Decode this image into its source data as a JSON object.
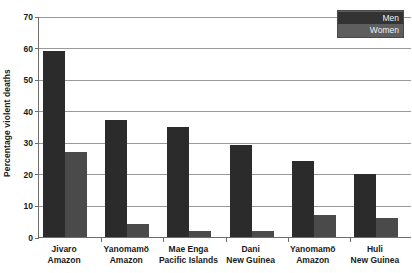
{
  "chart_data": {
    "type": "bar",
    "title": "",
    "subtitle": "",
    "xlabel": "",
    "ylabel": "Percentage violent deaths",
    "ylim": [
      0,
      70
    ],
    "ytick_step": 10,
    "yticks": [
      0,
      10,
      20,
      30,
      40,
      50,
      60,
      70
    ],
    "ytick_labels": [
      "0",
      "10",
      "20",
      "30",
      "40",
      "50",
      "60",
      "70"
    ],
    "grid": true,
    "legend_position": "top-right",
    "categories": [
      "Jivaro\nAmazon",
      "Yanomamö\nAmazon",
      "Mae Enga\nPacific Islands",
      "Dani\nNew Guinea",
      "Yanomamö\nAmazon",
      "Huli\nNew Guinea"
    ],
    "category_lines": [
      {
        "line1": "Jivaro",
        "line2": "Amazon"
      },
      {
        "line1": "Yanomamö",
        "line2": "Amazon"
      },
      {
        "line1": "Mae Enga",
        "line2": "Pacific Islands"
      },
      {
        "line1": "Dani",
        "line2": "New Guinea"
      },
      {
        "line1": "Yanomamö",
        "line2": "Amazon"
      },
      {
        "line1": "Huli",
        "line2": "New Guinea"
      }
    ],
    "series": [
      {
        "name": "Men",
        "color": "#2b2b2b",
        "values": [
          59,
          37,
          35,
          29,
          24,
          20
        ]
      },
      {
        "name": "Women",
        "color": "#4a4a4a",
        "values": [
          27,
          4,
          2,
          2,
          7,
          6
        ]
      }
    ],
    "annotations": []
  },
  "legend": {
    "items": [
      {
        "label": "Men",
        "color": "#2b2b2b",
        "selected": true
      },
      {
        "label": "Women",
        "color": "#4a4a4a",
        "selected": false
      }
    ]
  },
  "colors": {
    "men": "#2b2b2b",
    "women": "#4a4a4a",
    "gridline": "#9a9a9a",
    "axis": "#6d6d6d",
    "text": "#1a1a1a",
    "legend_background": "#5e5e5e",
    "legend_selected_background": "#333333",
    "legend_text": "#f2f2f2",
    "plot_background": "#ffffff"
  }
}
